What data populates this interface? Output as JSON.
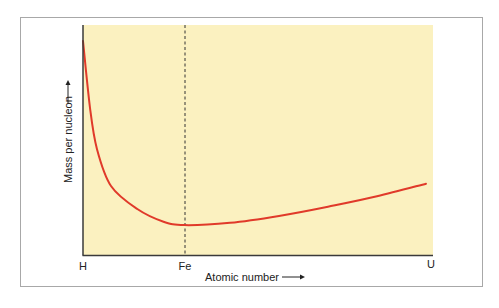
{
  "chart_data": {
    "type": "line",
    "title": "",
    "xlabel": "Atomic number",
    "ylabel": "Mass per nucleon",
    "x_tick_labels": [
      {
        "label": "H",
        "position": 0
      },
      {
        "label": "Fe",
        "position": 0.29
      },
      {
        "label": "U",
        "position": 1
      }
    ],
    "annotations": [
      {
        "type": "vertical-dashed-line",
        "at": "Fe"
      }
    ],
    "grid": false,
    "legend": null,
    "series": [
      {
        "name": "Mass per nucleon",
        "color": "#e03a2a",
        "x": [
          0.0,
          0.02,
          0.04,
          0.08,
          0.155,
          0.23,
          0.29,
          0.42,
          0.56,
          0.7,
          0.84,
          0.98
        ],
        "y": [
          0.93,
          0.64,
          0.46,
          0.3,
          0.2,
          0.145,
          0.13,
          0.14,
          0.17,
          0.21,
          0.255,
          0.31
        ]
      }
    ],
    "background_color": "#fbf1c0",
    "xlim": [
      0,
      1
    ],
    "ylim": [
      0,
      1
    ]
  },
  "axes": {
    "x_label": "Atomic number",
    "y_label": "Mass per nucleon",
    "arrow": "→",
    "ticks": {
      "h": "H",
      "fe": "Fe",
      "u": "U"
    }
  }
}
